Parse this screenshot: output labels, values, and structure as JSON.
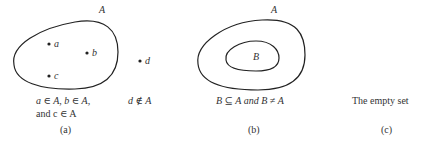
{
  "panels": [
    {
      "id": "a",
      "set_label": "A",
      "points": [
        {
          "label": "a"
        },
        {
          "label": "b"
        },
        {
          "label": "c"
        },
        {
          "label": "d"
        }
      ],
      "caption_line1": "a ∈ A,  b ∈ A,",
      "caption_line2": "and c ∈ A",
      "caption_side": "d ∉ A",
      "tag": "(a)"
    },
    {
      "id": "b",
      "outer_label": "A",
      "inner_label": "B",
      "caption": "B ⊆ A and B ≠ A",
      "tag": "(b)"
    },
    {
      "id": "c",
      "caption": "The empty set",
      "tag": "(c)"
    }
  ]
}
